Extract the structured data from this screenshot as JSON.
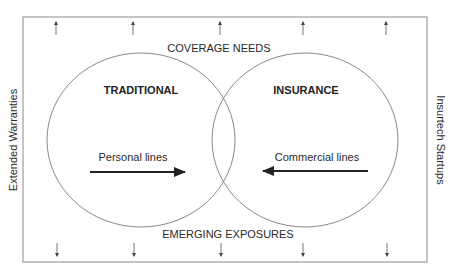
{
  "diagram": {
    "top_label": "COVERAGE NEEDS",
    "bottom_label": "EMERGING EXPOSURES",
    "left_label": "Extended Warranties",
    "right_label": "Insurtech Startups",
    "left_circle": {
      "title": "TRADITIONAL",
      "arrow_label": "Personal lines",
      "arrow_direction": "right"
    },
    "right_circle": {
      "title": "INSURANCE",
      "arrow_label": "Commercial lines",
      "arrow_direction": "left"
    },
    "top_arrows": {
      "count": 5,
      "direction": "up"
    },
    "bottom_arrows": {
      "count": 5,
      "direction": "down"
    },
    "colors": {
      "line": "#8a8a8a",
      "arrow": "#222222",
      "text": "#2a2a2a"
    }
  }
}
